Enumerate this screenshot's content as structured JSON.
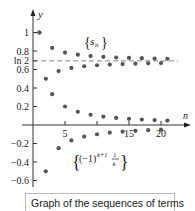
{
  "caption": "Graph of the sequences of terms",
  "chart_data": {
    "type": "scatter",
    "title": "",
    "xlabel": "n",
    "ylabel": "y",
    "x_ticks": [
      5,
      10,
      15,
      20
    ],
    "x_tick_labels": [
      "5",
      "",
      "15",
      "20"
    ],
    "y_ticks": [
      1,
      0.8,
      0.6,
      0.4,
      0.2,
      -0.2,
      -0.4,
      -0.6
    ],
    "y_tick_labels": [
      "1",
      "0.8",
      "0.6",
      "0.4",
      "0.2",
      "-0.2",
      "-0.4",
      "-0.6"
    ],
    "reference_line": {
      "label": "ln 2",
      "value": 0.6931,
      "style": "dashed"
    },
    "ylim": [
      -0.7,
      1.15
    ],
    "xlim": [
      0,
      22
    ],
    "grid": false,
    "series": [
      {
        "name": "{s_n}",
        "x": [
          1,
          2,
          3,
          4,
          5,
          6,
          7,
          8,
          9,
          10,
          11,
          12,
          13,
          14,
          15,
          16,
          17,
          18,
          19,
          20,
          21
        ],
        "values": [
          1.0,
          0.5,
          0.833,
          0.583,
          0.783,
          0.617,
          0.76,
          0.635,
          0.746,
          0.646,
          0.737,
          0.653,
          0.73,
          0.659,
          0.725,
          0.663,
          0.722,
          0.667,
          0.719,
          0.669,
          0.716
        ]
      },
      {
        "name": "{(-1)^(k+1) 1/k}",
        "x": [
          1,
          2,
          3,
          4,
          5,
          6,
          7,
          8,
          9,
          10,
          11,
          12,
          13,
          14,
          15,
          16,
          17,
          18,
          19,
          20,
          21
        ],
        "values": [
          1.0,
          -0.5,
          0.333,
          -0.25,
          0.2,
          -0.167,
          0.143,
          -0.125,
          0.111,
          -0.1,
          0.091,
          -0.083,
          0.077,
          -0.071,
          0.067,
          -0.063,
          0.059,
          -0.056,
          0.053,
          -0.05,
          0.048
        ]
      }
    ]
  },
  "labels": {
    "y_axis": "y",
    "x_axis": "n",
    "ln2": "ln 2",
    "sn_label": "s",
    "sn_sub": "n",
    "ak_label": "(−1)",
    "ak_exp": "k+1",
    "ak_frac_num": "1",
    "ak_frac_den": "k"
  }
}
